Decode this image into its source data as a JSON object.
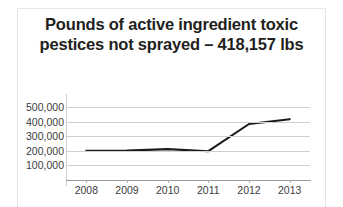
{
  "card": {
    "title_line1": "Pounds of active ingredient toxic",
    "title_line2": "pestices not sprayed – 418,157 lbs",
    "title_full": "Pounds of active ingredient toxic pestices not sprayed – 418,157 lbs",
    "title_color": "#231f20",
    "background_color": "#ffffff",
    "border_color": "#e3e3e3"
  },
  "chart_data": {
    "type": "line",
    "title": "Pounds of active ingredient toxic pestices not sprayed – 418,157 lbs",
    "xlabel": "",
    "ylabel": "",
    "categories": [
      "2008",
      "2009",
      "2010",
      "2011",
      "2012",
      "2013"
    ],
    "values": [
      200000,
      202000,
      212000,
      198000,
      385000,
      418157
    ],
    "ylim": [
      0,
      550000
    ],
    "ytick_values": [
      100000,
      200000,
      300000,
      400000,
      500000
    ],
    "ytick_labels": [
      "100,000",
      "200,000",
      "300,000",
      "400,000",
      "500,000"
    ],
    "grid": true,
    "legend": "none",
    "line_color": "#1a1a1a",
    "gridline_color": "#d0d0d0",
    "axis_color": "#9a9a9a",
    "tick_label_color": "#3b3b3b"
  }
}
